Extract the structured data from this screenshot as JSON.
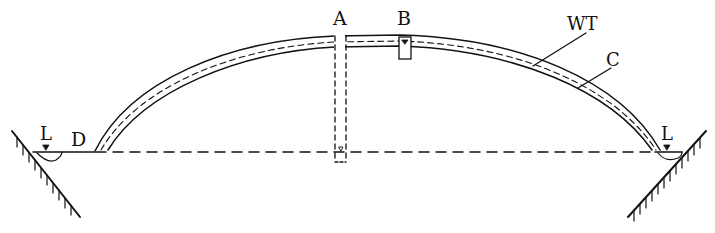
{
  "diagram": {
    "type": "cross-section",
    "colors": {
      "ink": "#111111",
      "background": "#ffffff"
    },
    "labels": {
      "A": "A",
      "B": "B",
      "WT": "WT",
      "C": "C",
      "D": "D",
      "L_left": "L",
      "L_right": "L"
    }
  }
}
